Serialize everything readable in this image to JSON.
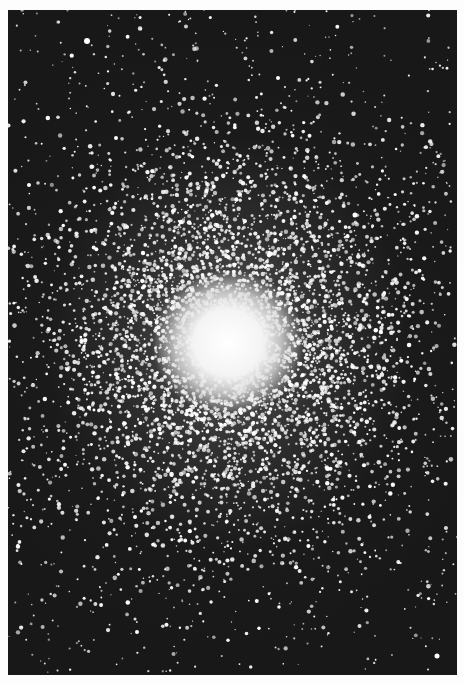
{
  "image": {
    "subject": "globular star cluster photograph (black and white)",
    "background_color": "#fdfdfd",
    "sky_color": "#181818",
    "frame": {
      "left": 8,
      "top": 10,
      "width": 449,
      "height": 665
    },
    "cluster_center": {
      "x": 222,
      "y": 335
    },
    "core_radius_px": 60,
    "halo_radius_px": 220,
    "star_color": "#ffffff",
    "bright_field_stars": [
      {
        "x": 79,
        "y": 31,
        "r": 3
      },
      {
        "x": 21,
        "y": 175,
        "r": 2
      },
      {
        "x": 347,
        "y": 205,
        "r": 2.5
      },
      {
        "x": 127,
        "y": 507,
        "r": 2
      },
      {
        "x": 129,
        "y": 622,
        "r": 2
      },
      {
        "x": 429,
        "y": 646,
        "r": 2.5
      },
      {
        "x": 270,
        "y": 68,
        "r": 2
      },
      {
        "x": 108,
        "y": 128,
        "r": 2
      }
    ]
  }
}
